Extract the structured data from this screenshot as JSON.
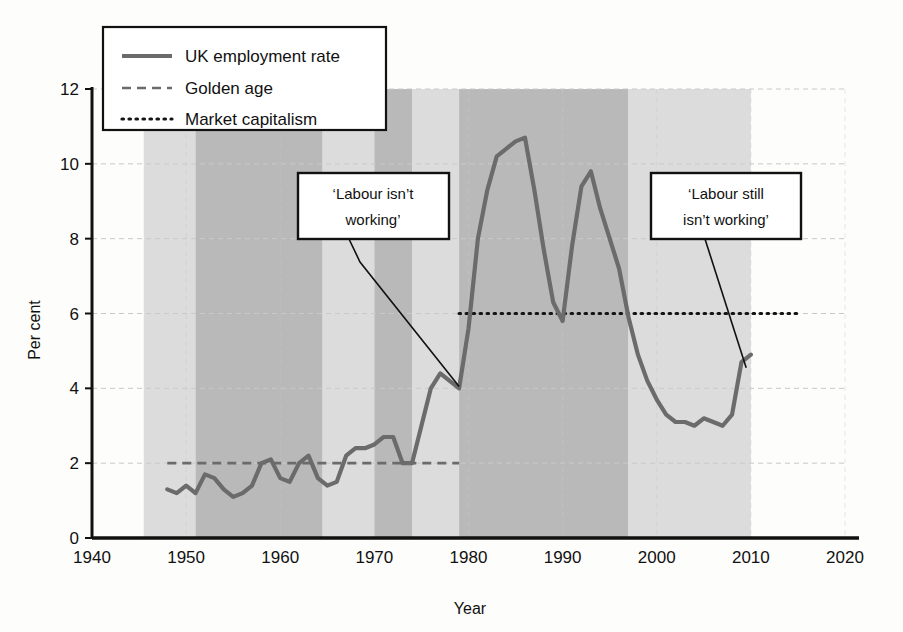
{
  "chart_data": {
    "type": "line",
    "title": "",
    "xlabel": "Year",
    "ylabel": "Per cent",
    "xlim": [
      1940,
      2020
    ],
    "ylim": [
      0,
      12
    ],
    "xticks": [
      "1940",
      "1950",
      "1960",
      "1970",
      "1980",
      "1990",
      "2000",
      "2010",
      "2020"
    ],
    "yticks": [
      "0",
      "2",
      "4",
      "6",
      "8",
      "10",
      "12"
    ],
    "grid": "horizontal dashed, faint",
    "legend_position": "top-left inside plot",
    "legend": [
      {
        "label": "UK employment rate",
        "style": "solid",
        "color": "#6b6b6b"
      },
      {
        "label": "Golden age",
        "style": "dashed",
        "color": "#6b6b6b"
      },
      {
        "label": "Market capitalism",
        "style": "dotted",
        "color": "#111111"
      }
    ],
    "series": [
      {
        "name": "UK employment rate",
        "style": "solid",
        "x": [
          1948,
          1949,
          1950,
          1951,
          1952,
          1953,
          1954,
          1955,
          1956,
          1957,
          1958,
          1959,
          1960,
          1961,
          1962,
          1963,
          1964,
          1965,
          1966,
          1967,
          1968,
          1969,
          1970,
          1971,
          1972,
          1973,
          1974,
          1975,
          1976,
          1977,
          1978,
          1979,
          1980,
          1981,
          1982,
          1983,
          1984,
          1985,
          1986,
          1987,
          1988,
          1989,
          1990,
          1991,
          1992,
          1993,
          1994,
          1995,
          1996,
          1997,
          1998,
          1999,
          2000,
          2001,
          2002,
          2003,
          2004,
          2005,
          2006,
          2007,
          2008,
          2009,
          2010
        ],
        "values": [
          1.3,
          1.2,
          1.4,
          1.2,
          1.7,
          1.6,
          1.3,
          1.1,
          1.2,
          1.4,
          2.0,
          2.1,
          1.6,
          1.5,
          2.0,
          2.2,
          1.6,
          1.4,
          1.5,
          2.2,
          2.4,
          2.4,
          2.5,
          2.7,
          2.7,
          2.0,
          2.0,
          3.0,
          4.0,
          4.4,
          4.2,
          4.0,
          5.6,
          8.0,
          9.3,
          10.2,
          10.4,
          10.6,
          10.7,
          9.3,
          7.7,
          6.3,
          5.8,
          7.8,
          9.4,
          9.8,
          8.8,
          8.0,
          7.2,
          5.9,
          4.9,
          4.2,
          3.7,
          3.3,
          3.1,
          3.1,
          3.0,
          3.2,
          3.1,
          3.0,
          3.3,
          4.7,
          4.9
        ]
      },
      {
        "name": "Golden age",
        "style": "dashed",
        "x": [
          1948,
          1979
        ],
        "values": [
          2.0,
          2.0
        ]
      },
      {
        "name": "Market capitalism",
        "style": "dotted",
        "x": [
          1979,
          2015
        ],
        "values": [
          6.0,
          6.0
        ]
      }
    ],
    "shaded_bands": [
      {
        "from": 1945.5,
        "to": 1951.0,
        "shade": "light"
      },
      {
        "from": 1951.0,
        "to": 1964.5,
        "shade": "dark"
      },
      {
        "from": 1964.5,
        "to": 1970.0,
        "shade": "light"
      },
      {
        "from": 1970.0,
        "to": 1974.0,
        "shade": "dark"
      },
      {
        "from": 1974.0,
        "to": 1979.0,
        "shade": "light"
      },
      {
        "from": 1979.0,
        "to": 1997.0,
        "shade": "dark"
      },
      {
        "from": 1997.0,
        "to": 2010.0,
        "shade": "light"
      }
    ],
    "annotations": [
      {
        "id": "labour-isnt-working",
        "lines": [
          "‘Labour isn’t",
          "working’"
        ],
        "points_to_year": 1979,
        "points_to_value": 4.05
      },
      {
        "id": "labour-still-isnt-working",
        "lines": [
          "‘Labour still",
          "isn’t working’"
        ],
        "points_to_year": 2009.5,
        "points_to_value": 4.55
      }
    ]
  },
  "colors": {
    "series_line": "#6b6b6b",
    "dotted_line": "#141414",
    "band_dark": "#b9b9b9",
    "band_light": "#dcdcdc",
    "axis": "#111111",
    "grid": "#c9c9c9",
    "background": "#fdfdfb"
  }
}
